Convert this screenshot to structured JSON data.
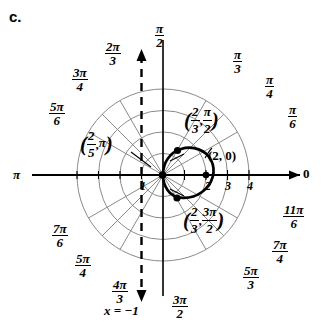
{
  "panel_label": "c.",
  "geometry": {
    "pole_x": 163,
    "pole_y": 175,
    "unit_px": 21.5,
    "grid_rings": [
      1,
      2,
      3,
      4
    ],
    "spoke_count": 12
  },
  "colors": {
    "grid": "#8a8a8a",
    "axis": "#000000",
    "curve": "#000000",
    "directrix": "#000000",
    "background": "#ffffff"
  },
  "axis_labels": {
    "polar_axis_zero": "0",
    "pi_left": "π"
  },
  "radial_ticks": [
    "1",
    "2",
    "3",
    "4"
  ],
  "angle_labels": [
    {
      "name": "pi-over-2",
      "num": "π",
      "den": "2",
      "deg": 90,
      "x": 155,
      "y": 22
    },
    {
      "name": "2pi-over-3",
      "num": "2π",
      "den": "3",
      "deg": 120,
      "x": 105,
      "y": 40
    },
    {
      "name": "3pi-over-4",
      "num": "3π",
      "den": "4",
      "deg": 135,
      "x": 72,
      "y": 66
    },
    {
      "name": "5pi-over-6",
      "num": "5π",
      "den": "6",
      "deg": 150,
      "x": 49,
      "y": 100
    },
    {
      "name": "7pi-over-6",
      "num": "7π",
      "den": "6",
      "deg": 210,
      "x": 52,
      "y": 222
    },
    {
      "name": "5pi-over-4",
      "num": "5π",
      "den": "4",
      "deg": 225,
      "x": 75,
      "y": 252
    },
    {
      "name": "4pi-over-3",
      "num": "4π",
      "den": "3",
      "deg": 240,
      "x": 112,
      "y": 278
    },
    {
      "name": "3pi-over-2",
      "num": "3π",
      "den": "2",
      "deg": 270,
      "x": 172,
      "y": 293
    },
    {
      "name": "5pi-over-3",
      "num": "5π",
      "den": "3",
      "deg": 300,
      "x": 243,
      "y": 264
    },
    {
      "name": "7pi-over-4",
      "num": "7π",
      "den": "4",
      "deg": 315,
      "x": 272,
      "y": 238
    },
    {
      "name": "11pi-over-6",
      "num": "11π",
      "den": "6",
      "deg": 330,
      "x": 283,
      "y": 203
    },
    {
      "name": "pi-over-6",
      "num": "π",
      "den": "6",
      "deg": 30,
      "x": 288,
      "y": 103
    },
    {
      "name": "pi-over-4",
      "num": "π",
      "den": "4",
      "deg": 45,
      "x": 265,
      "y": 73
    },
    {
      "name": "pi-over-3",
      "num": "π",
      "den": "3",
      "deg": 60,
      "x": 233,
      "y": 48
    }
  ],
  "point_annotations": [
    {
      "name": "vertex-2-0",
      "text": "(2, 0)",
      "x": 208,
      "y": 148
    },
    {
      "name": "point-2-3-pi-over-2",
      "r_num": "2",
      "r_den": "3",
      "a_num": "π",
      "a_den": "2",
      "x": 184,
      "y": 104
    },
    {
      "name": "point-2-3-3pi-over-2",
      "r_num": "2",
      "r_den": "3",
      "a_num": "3π",
      "a_den": "2",
      "x": 183,
      "y": 204
    },
    {
      "name": "point-2-5-pi",
      "r_num": "2",
      "r_den": "5",
      "a_text": "π",
      "x": 80,
      "y": 128
    }
  ],
  "directrix": {
    "label": "x = −1",
    "x_value": -1,
    "label_x": 104,
    "label_y": 303
  },
  "chart_data": {
    "type": "line",
    "coordinate_system": "polar",
    "grid": true,
    "rlim": [
      0,
      4
    ],
    "r_ticks": [
      1,
      2,
      3,
      4
    ],
    "theta_ticks_deg": [
      0,
      30,
      45,
      60,
      90,
      120,
      135,
      150,
      180,
      210,
      225,
      240,
      270,
      300,
      315,
      330
    ],
    "series": [
      {
        "name": "conic",
        "equation": "r = 2/(1 + 2 cos(theta))",
        "labeled_points": [
          {
            "r": 2,
            "theta": "0",
            "label": "(2, 0)"
          },
          {
            "r": 0.6667,
            "theta": "pi/2",
            "label": "(2/3, pi/2)"
          },
          {
            "r": 0.6667,
            "theta": "3pi/2",
            "label": "(2/3, 3pi/2)"
          },
          {
            "r": 0.4,
            "theta": "pi",
            "label": "(2/5, pi)"
          }
        ]
      },
      {
        "name": "directrix",
        "equation": "x = -1",
        "style": "dashed"
      }
    ]
  }
}
